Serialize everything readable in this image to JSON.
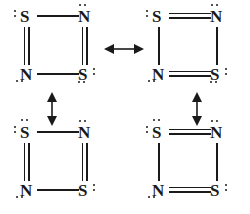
{
  "diagram": {
    "ink_color": "#1a1a1a",
    "background_color": "#ffffff"
  },
  "structures": [
    {
      "id": "structure-top-left",
      "position": "top-left",
      "atoms": [
        {
          "pos": "top-left",
          "symbol": "S",
          "lone_pairs": [
            "left"
          ]
        },
        {
          "pos": "top-right",
          "symbol": "N",
          "lone_pairs": [
            "top"
          ]
        },
        {
          "pos": "bottom-left",
          "symbol": "N",
          "lone_pairs": [
            "bottom-left"
          ]
        },
        {
          "pos": "bottom-right",
          "symbol": "S",
          "lone_pairs": [
            "right",
            "bottom"
          ]
        }
      ],
      "bonds": [
        {
          "edge": "top",
          "order": 1
        },
        {
          "edge": "right",
          "order": 2
        },
        {
          "edge": "bottom",
          "order": 1
        },
        {
          "edge": "left",
          "order": 2
        }
      ]
    },
    {
      "id": "structure-top-right",
      "position": "top-right",
      "atoms": [
        {
          "pos": "top-left",
          "symbol": "S",
          "lone_pairs": [
            "left"
          ]
        },
        {
          "pos": "top-right",
          "symbol": "N",
          "lone_pairs": [
            "top"
          ]
        },
        {
          "pos": "bottom-left",
          "symbol": "N",
          "lone_pairs": [
            "bottom-left"
          ]
        },
        {
          "pos": "bottom-right",
          "symbol": "S",
          "lone_pairs": [
            "right",
            "bottom"
          ]
        }
      ],
      "bonds": [
        {
          "edge": "top",
          "order": 2
        },
        {
          "edge": "right",
          "order": 1
        },
        {
          "edge": "bottom",
          "order": 2
        },
        {
          "edge": "left",
          "order": 1
        }
      ]
    },
    {
      "id": "structure-bottom-left",
      "position": "bottom-left",
      "atoms": [
        {
          "pos": "top-left",
          "symbol": "S",
          "lone_pairs": [
            "left",
            "top"
          ]
        },
        {
          "pos": "top-right",
          "symbol": "N",
          "lone_pairs": [
            "top"
          ]
        },
        {
          "pos": "bottom-left",
          "symbol": "N",
          "lone_pairs": [
            "bottom-left"
          ]
        },
        {
          "pos": "bottom-right",
          "symbol": "S",
          "lone_pairs": [
            "right"
          ]
        }
      ],
      "bonds": [
        {
          "edge": "top",
          "order": 1
        },
        {
          "edge": "right",
          "order": 2
        },
        {
          "edge": "bottom",
          "order": 1
        },
        {
          "edge": "left",
          "order": 2
        }
      ]
    },
    {
      "id": "structure-bottom-right",
      "position": "bottom-right",
      "atoms": [
        {
          "pos": "top-left",
          "symbol": "S",
          "lone_pairs": [
            "left",
            "top"
          ]
        },
        {
          "pos": "top-right",
          "symbol": "N",
          "lone_pairs": [
            "top"
          ]
        },
        {
          "pos": "bottom-left",
          "symbol": "N",
          "lone_pairs": [
            "bottom-left"
          ]
        },
        {
          "pos": "bottom-right",
          "symbol": "S",
          "lone_pairs": [
            "right"
          ]
        }
      ],
      "bonds": [
        {
          "edge": "top",
          "order": 2
        },
        {
          "edge": "right",
          "order": 1
        },
        {
          "edge": "bottom",
          "order": 2
        },
        {
          "edge": "left",
          "order": 1
        }
      ]
    }
  ],
  "arrows": [
    {
      "id": "arrow-top-horizontal",
      "orientation": "horizontal",
      "heads": "double",
      "connects": [
        "structure-top-left",
        "structure-top-right"
      ]
    },
    {
      "id": "arrow-left-vertical",
      "orientation": "vertical",
      "heads": "double",
      "connects": [
        "structure-top-left",
        "structure-bottom-left"
      ]
    },
    {
      "id": "arrow-right-vertical",
      "orientation": "vertical",
      "heads": "double",
      "connects": [
        "structure-top-right",
        "structure-bottom-right"
      ]
    }
  ],
  "labels": {
    "sulfur": "S",
    "nitrogen": "N"
  }
}
